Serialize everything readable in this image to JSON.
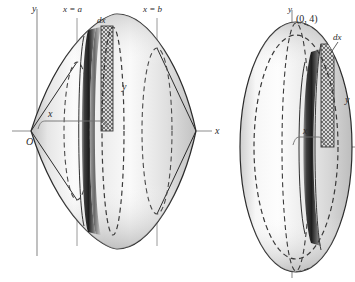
{
  "figure": {
    "type": "math-diagram",
    "panels": [
      {
        "id": "left",
        "name": "lens-solid-of-revolution",
        "axes": {
          "y_axis_label": "y",
          "x_axis_label": "x",
          "origin_label": "O"
        },
        "labels": {
          "lower_limit": "x = a",
          "upper_limit": "x = b",
          "thickness": "dx",
          "radius": "y",
          "distance": "x"
        },
        "guide_lines": [
          "x = a",
          "x = b"
        ],
        "slice": {
          "shading": "cross-hatch",
          "thickness_label": "dx",
          "radius_label": "y"
        }
      },
      {
        "id": "right",
        "name": "ellipsoid-solid-of-revolution",
        "axes": {
          "y_axis_label": "y",
          "origin_label": "O"
        },
        "labels": {
          "vertex_point": "(0, 4)",
          "thickness": "dx",
          "radius": "y",
          "distance": "x"
        },
        "slice": {
          "shading": "cross-hatch",
          "thickness_label": "dx",
          "radius_label": "y"
        }
      }
    ]
  },
  "colors": {
    "ink": "#2b2b2b",
    "axis": "#8d8d8d",
    "guide": "#9a9a9a",
    "solid_light": "#f2f2f2",
    "solid_mid": "#c9c9c9",
    "solid_dark": "#555555",
    "band_dark": "#3a3a3a",
    "hatch": "#6f6f6f"
  }
}
